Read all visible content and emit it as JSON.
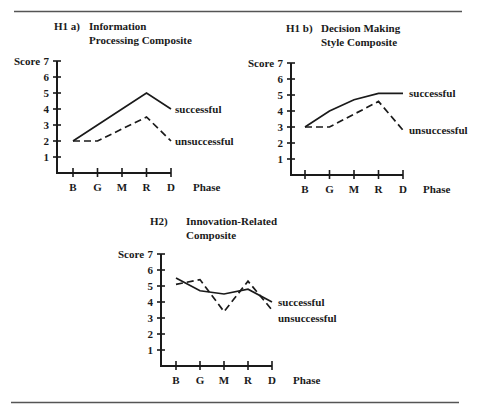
{
  "chart_data": [
    {
      "type": "line",
      "id": "h1a",
      "label": "H1 a)",
      "title_lines": [
        "Information",
        "Processing Composite"
      ],
      "ylabel": "Score",
      "xlabel": "Phase",
      "categories": [
        "B",
        "G",
        "M",
        "R",
        "D"
      ],
      "yticks": [
        1,
        2,
        3,
        4,
        5,
        6,
        7
      ],
      "ylim": [
        0,
        7
      ],
      "grid": false,
      "legend_position": "inline-right",
      "series": [
        {
          "name": "successful",
          "style": "solid",
          "values": [
            2.0,
            3.0,
            4.0,
            5.0,
            4.0
          ]
        },
        {
          "name": "unsuccessful",
          "style": "dashed",
          "values": [
            2.0,
            2.0,
            2.75,
            3.5,
            2.0
          ]
        }
      ]
    },
    {
      "type": "line",
      "id": "h1b",
      "label": "H1 b)",
      "title_lines": [
        "Decision Making",
        "Style Composite"
      ],
      "ylabel": "Score",
      "xlabel": "Phase",
      "categories": [
        "B",
        "G",
        "M",
        "R",
        "D"
      ],
      "yticks": [
        1,
        2,
        3,
        4,
        5,
        6,
        7
      ],
      "ylim": [
        0,
        7
      ],
      "grid": false,
      "legend_position": "inline-right",
      "series": [
        {
          "name": "successful",
          "style": "solid",
          "values": [
            3.0,
            4.0,
            4.7,
            5.1,
            5.1
          ]
        },
        {
          "name": "unsuccessful",
          "style": "dashed",
          "values": [
            3.0,
            3.0,
            3.8,
            4.6,
            2.8
          ]
        }
      ]
    },
    {
      "type": "line",
      "id": "h2",
      "label": "H2)",
      "title_lines": [
        "Innovation-Related",
        "Composite"
      ],
      "ylabel": "Score",
      "xlabel": "Phase",
      "categories": [
        "B",
        "G",
        "M",
        "R",
        "D"
      ],
      "yticks": [
        1,
        2,
        3,
        4,
        5,
        6,
        7
      ],
      "ylim": [
        0,
        7
      ],
      "grid": false,
      "legend_position": "inline-right",
      "series": [
        {
          "name": "successful",
          "style": "solid",
          "values": [
            5.5,
            4.7,
            4.5,
            4.8,
            4.0
          ]
        },
        {
          "name": "unsuccessful",
          "style": "dashed",
          "values": [
            5.1,
            5.4,
            3.4,
            5.3,
            3.5
          ]
        }
      ]
    }
  ]
}
